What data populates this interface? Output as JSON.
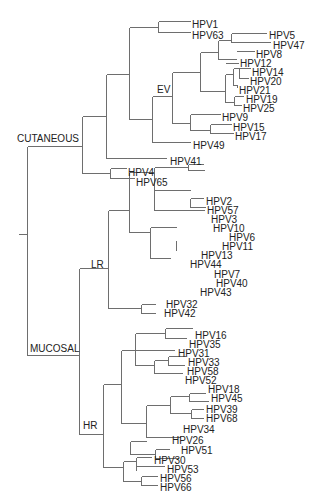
{
  "diagram": {
    "type": "phylogenetic-tree",
    "line_color": "#6e6e6e",
    "text_color": "#222222",
    "group_labels": [
      {
        "id": "cutaneous",
        "text": "CUTANEOUS",
        "x": 17,
        "y": 142
      },
      {
        "id": "ev",
        "text": "EV",
        "x": 157,
        "y": 93
      },
      {
        "id": "lr",
        "text": "LR",
        "x": 91,
        "y": 268
      },
      {
        "id": "mucosal",
        "text": "MUCOSAL",
        "x": 30,
        "y": 352
      },
      {
        "id": "hr",
        "text": "HR",
        "x": 83,
        "y": 429
      }
    ],
    "leaves": [
      {
        "name": "HPV1",
        "x": 192,
        "y": 24
      },
      {
        "name": "HPV63",
        "x": 192,
        "y": 35
      },
      {
        "name": "HPV5",
        "x": 269,
        "y": 35
      },
      {
        "name": "HPV47",
        "x": 273,
        "y": 45
      },
      {
        "name": "HPV8",
        "x": 256,
        "y": 54
      },
      {
        "name": "HPV12",
        "x": 240,
        "y": 63
      },
      {
        "name": "HPV14",
        "x": 252,
        "y": 72
      },
      {
        "name": "HPV20",
        "x": 250,
        "y": 81
      },
      {
        "name": "HPV21",
        "x": 239,
        "y": 90
      },
      {
        "name": "HPV19",
        "x": 246,
        "y": 99
      },
      {
        "name": "HPV25",
        "x": 243,
        "y": 108
      },
      {
        "name": "HPV9",
        "x": 222,
        "y": 117
      },
      {
        "name": "HPV15",
        "x": 233,
        "y": 127
      },
      {
        "name": "HPV17",
        "x": 235,
        "y": 136
      },
      {
        "name": "HPV49",
        "x": 193,
        "y": 145
      },
      {
        "name": "HPV41",
        "x": 170,
        "y": 161
      },
      {
        "name": "HPV4",
        "x": 128,
        "y": 172
      },
      {
        "name": "HPV65",
        "x": 136,
        "y": 182
      },
      {
        "name": "HPV2",
        "x": 206,
        "y": 201
      },
      {
        "name": "HPV57",
        "x": 207,
        "y": 210
      },
      {
        "name": "HPV3",
        "x": 211,
        "y": 219
      },
      {
        "name": "HPV10",
        "x": 213,
        "y": 228
      },
      {
        "name": "HPV6",
        "x": 229,
        "y": 237
      },
      {
        "name": "HPV11",
        "x": 222,
        "y": 246
      },
      {
        "name": "HPV13",
        "x": 201,
        "y": 255
      },
      {
        "name": "HPV44",
        "x": 190,
        "y": 264
      },
      {
        "name": "HPV7",
        "x": 214,
        "y": 274
      },
      {
        "name": "HPV40",
        "x": 216,
        "y": 283
      },
      {
        "name": "HPV43",
        "x": 200,
        "y": 292
      },
      {
        "name": "HPV32",
        "x": 166,
        "y": 304
      },
      {
        "name": "HPV42",
        "x": 164,
        "y": 313
      },
      {
        "name": "HPV16",
        "x": 195,
        "y": 335
      },
      {
        "name": "HPV35",
        "x": 189,
        "y": 344
      },
      {
        "name": "HPV31",
        "x": 178,
        "y": 353
      },
      {
        "name": "HPV33",
        "x": 188,
        "y": 362
      },
      {
        "name": "HPV58",
        "x": 187,
        "y": 371
      },
      {
        "name": "HPV52",
        "x": 185,
        "y": 380
      },
      {
        "name": "HPV18",
        "x": 208,
        "y": 389
      },
      {
        "name": "HPV45",
        "x": 211,
        "y": 398
      },
      {
        "name": "HPV39",
        "x": 206,
        "y": 409
      },
      {
        "name": "HPV68",
        "x": 206,
        "y": 418
      },
      {
        "name": "HPV34",
        "x": 183,
        "y": 429
      },
      {
        "name": "HPV26",
        "x": 172,
        "y": 440
      },
      {
        "name": "HPV51",
        "x": 181,
        "y": 450
      },
      {
        "name": "HPV30",
        "x": 154,
        "y": 460
      },
      {
        "name": "HPV53",
        "x": 167,
        "y": 469
      },
      {
        "name": "HPV56",
        "x": 160,
        "y": 478
      },
      {
        "name": "HPV66",
        "x": 160,
        "y": 487
      }
    ],
    "edges": [
      [
        18,
        234,
        27,
        234
      ],
      [
        27,
        146,
        27,
        355
      ],
      [
        27,
        146,
        82,
        146
      ],
      [
        27,
        355,
        79,
        355
      ],
      [
        82,
        116,
        82,
        173
      ],
      [
        82,
        116,
        106,
        116
      ],
      [
        82,
        173,
        110,
        173
      ],
      [
        106,
        74,
        106,
        158
      ],
      [
        106,
        74,
        129,
        74
      ],
      [
        106,
        158,
        166,
        158
      ],
      [
        129,
        27,
        129,
        119
      ],
      [
        129,
        27,
        158,
        27
      ],
      [
        129,
        119,
        152,
        119
      ],
      [
        158,
        21,
        158,
        32
      ],
      [
        158,
        21,
        190,
        21
      ],
      [
        158,
        32,
        190,
        32
      ],
      [
        152,
        96,
        152,
        142
      ],
      [
        152,
        96,
        172,
        96
      ],
      [
        152,
        142,
        190,
        142
      ],
      [
        172,
        72,
        172,
        123
      ],
      [
        172,
        72,
        200,
        72
      ],
      [
        172,
        123,
        190,
        123
      ],
      [
        200,
        52,
        200,
        91
      ],
      [
        200,
        52,
        218,
        52
      ],
      [
        200,
        91,
        225,
        91
      ],
      [
        218,
        40,
        218,
        59
      ],
      [
        218,
        40,
        231,
        40
      ],
      [
        218,
        59,
        236,
        59
      ],
      [
        231,
        33,
        231,
        42
      ],
      [
        231,
        33,
        266,
        33
      ],
      [
        231,
        42,
        270,
        42
      ],
      [
        236,
        51,
        254,
        51
      ],
      [
        218,
        59,
        218,
        59
      ],
      [
        225,
        74,
        225,
        102
      ],
      [
        225,
        74,
        233,
        74
      ],
      [
        225,
        102,
        234,
        102
      ],
      [
        233,
        68,
        233,
        85
      ],
      [
        233,
        68,
        239,
        68
      ],
      [
        233,
        85,
        237,
        85
      ],
      [
        239,
        68,
        239,
        78
      ],
      [
        239,
        68,
        250,
        68
      ],
      [
        239,
        78,
        248,
        78
      ],
      [
        237,
        87,
        237,
        87
      ],
      [
        237,
        85,
        237,
        87
      ],
      [
        234,
        96,
        234,
        105
      ],
      [
        234,
        96,
        243,
        96
      ],
      [
        234,
        105,
        241,
        105
      ],
      [
        225,
        63,
        238,
        63
      ],
      [
        200,
        63,
        200,
        63
      ],
      [
        190,
        114,
        190,
        130
      ],
      [
        190,
        114,
        220,
        114
      ],
      [
        190,
        130,
        210,
        130
      ],
      [
        210,
        124,
        210,
        133
      ],
      [
        210,
        124,
        231,
        124
      ],
      [
        210,
        133,
        233,
        133
      ],
      [
        110,
        168,
        110,
        178
      ],
      [
        110,
        168,
        126,
        168
      ],
      [
        110,
        178,
        134,
        178
      ],
      [
        79,
        268,
        79,
        434
      ],
      [
        79,
        268,
        108,
        268
      ],
      [
        79,
        434,
        103,
        434
      ],
      [
        108,
        210,
        108,
        308
      ],
      [
        108,
        210,
        129,
        210
      ],
      [
        108,
        308,
        141,
        308
      ],
      [
        129,
        172,
        129,
        232
      ],
      [
        129,
        172,
        154,
        172
      ],
      [
        129,
        232,
        150,
        232
      ],
      [
        154,
        167,
        154,
        210
      ],
      [
        154,
        167,
        188,
        167
      ],
      [
        154,
        210,
        204,
        210
      ],
      [
        188,
        164,
        188,
        170
      ],
      [
        188,
        164,
        203,
        164
      ],
      [
        188,
        170,
        204,
        170
      ],
      [
        188,
        161,
        188,
        161
      ],
      [
        190,
        198,
        190,
        207
      ],
      [
        190,
        198,
        203,
        198
      ],
      [
        190,
        207,
        205,
        207
      ],
      [
        154,
        190,
        190,
        190
      ],
      [
        188,
        164,
        188,
        164
      ],
      [
        150,
        227,
        150,
        258
      ],
      [
        150,
        227,
        176,
        227
      ],
      [
        150,
        258,
        170,
        258
      ],
      [
        176,
        243,
        176,
        250
      ],
      [
        176,
        240,
        176,
        250
      ],
      [
        141,
        304,
        141,
        313
      ],
      [
        141,
        304,
        155,
        304
      ],
      [
        141,
        313,
        155,
        313
      ],
      [
        103,
        384,
        103,
        467
      ],
      [
        103,
        384,
        121,
        384
      ],
      [
        103,
        467,
        123,
        467
      ],
      [
        121,
        350,
        121,
        423
      ],
      [
        121,
        350,
        135,
        350
      ],
      [
        121,
        423,
        146,
        423
      ],
      [
        135,
        333,
        135,
        365
      ],
      [
        135,
        333,
        165,
        333
      ],
      [
        135,
        365,
        154,
        365
      ],
      [
        165,
        328,
        165,
        338
      ],
      [
        165,
        328,
        192,
        328
      ],
      [
        165,
        338,
        186,
        338
      ],
      [
        135,
        350,
        174,
        350
      ],
      [
        154,
        360,
        154,
        373
      ],
      [
        154,
        360,
        168,
        360
      ],
      [
        154,
        373,
        182,
        373
      ],
      [
        168,
        356,
        168,
        365
      ],
      [
        168,
        356,
        185,
        356
      ],
      [
        168,
        365,
        184,
        365
      ],
      [
        146,
        405,
        146,
        437
      ],
      [
        146,
        405,
        170,
        405
      ],
      [
        146,
        437,
        180,
        437
      ],
      [
        170,
        396,
        170,
        413
      ],
      [
        170,
        396,
        189,
        396
      ],
      [
        170,
        413,
        191,
        413
      ],
      [
        189,
        393,
        189,
        401
      ],
      [
        189,
        393,
        205,
        393
      ],
      [
        189,
        401,
        208,
        401
      ],
      [
        191,
        409,
        191,
        418
      ],
      [
        191,
        409,
        203,
        409
      ],
      [
        191,
        418,
        203,
        418
      ],
      [
        130,
        441,
        130,
        454
      ],
      [
        130,
        441,
        146,
        441
      ],
      [
        130,
        454,
        155,
        454
      ],
      [
        155,
        449,
        155,
        458
      ],
      [
        155,
        449,
        169,
        449
      ],
      [
        155,
        458,
        178,
        458
      ],
      [
        123,
        461,
        123,
        481
      ],
      [
        123,
        461,
        136,
        461
      ],
      [
        123,
        481,
        141,
        481
      ],
      [
        136,
        457,
        136,
        470
      ],
      [
        136,
        457,
        151,
        457
      ],
      [
        136,
        466,
        164,
        466
      ],
      [
        141,
        476,
        141,
        485
      ],
      [
        141,
        476,
        157,
        476
      ],
      [
        141,
        485,
        157,
        485
      ]
    ]
  }
}
